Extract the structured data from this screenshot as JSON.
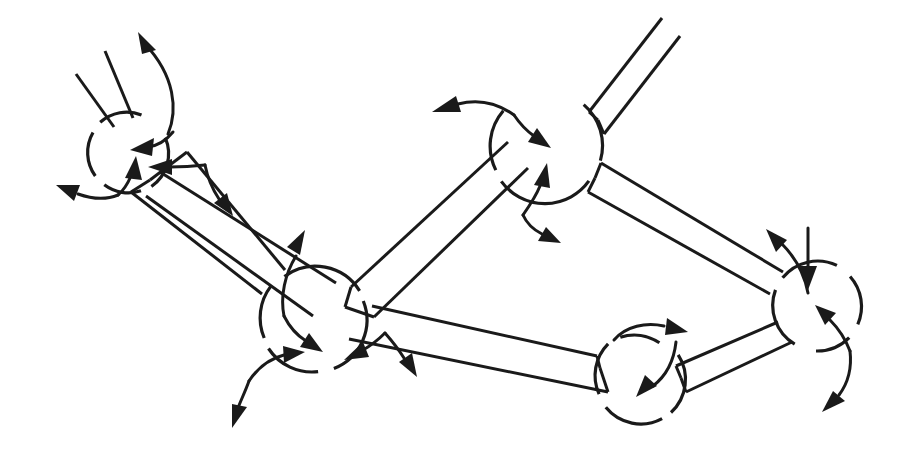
{
  "figure": {
    "kind": "diagram",
    "background_color": "#ffffff",
    "stroke_color": "#1a1a1a",
    "stroke_width": 3,
    "canvas": {
      "width": 911,
      "height": 459
    }
  },
  "nodes": [
    {
      "id": "node-top-left",
      "label": "top-left vertex",
      "cx": 128,
      "cy": 152,
      "r": 40,
      "gaps": [
        {
          "from": 206,
          "to": 262
        },
        {
          "from": 288,
          "to": 330
        },
        {
          "from": 30,
          "to": 66
        },
        {
          "from": 92,
          "to": 122
        }
      ]
    },
    {
      "id": "node-left-lower",
      "label": "left lower vertex",
      "cx": 312,
      "cy": 320,
      "r": 52,
      "gaps": [
        {
          "from": 122,
          "to": 168
        },
        {
          "from": 286,
          "to": 326
        },
        {
          "from": 38,
          "to": 72
        }
      ]
    },
    {
      "id": "node-top-right",
      "label": "top-right vertex",
      "cx": 549,
      "cy": 146,
      "r": 54,
      "gaps": [
        {
          "from": 300,
          "to": 345
        },
        {
          "from": 160,
          "to": 205
        },
        {
          "from": 8,
          "to": 50
        }
      ]
    },
    {
      "id": "node-bottom-right",
      "label": "bottom-right vertex",
      "cx": 637,
      "cy": 381,
      "r": 45,
      "gaps": [
        {
          "from": 128,
          "to": 176
        },
        {
          "from": 346,
          "to": 24
        },
        {
          "from": 56,
          "to": 86
        }
      ]
    },
    {
      "id": "node-right",
      "label": "right vertex",
      "cx": 816,
      "cy": 306,
      "r": 45,
      "gaps": [
        {
          "from": 150,
          "to": 198
        },
        {
          "from": 200,
          "to": 240
        },
        {
          "from": 118,
          "to": 146
        }
      ]
    }
  ],
  "edges": [
    {
      "id": "edge-top-left-to-open-upper",
      "label": "open tube from top-left vertex going up-left"
    },
    {
      "id": "edge-top-left-to-left-lower",
      "label": "tube from top-left vertex down to left lower vertex"
    },
    {
      "id": "edge-top-left-to-top-right-cross",
      "label": "long tube from top-left vertex crossing to top-right region"
    },
    {
      "id": "edge-left-lower-to-top-right",
      "label": "tube from left lower vertex up-right to top-right vertex"
    },
    {
      "id": "edge-top-right-to-open-upper-right",
      "label": "open tube from top-right vertex going up-right off canvas"
    },
    {
      "id": "edge-top-right-to-right",
      "label": "tube from top-right vertex down-right to right vertex"
    },
    {
      "id": "edge-bottom-right-to-right",
      "label": "tube from bottom-right vertex to right vertex"
    },
    {
      "id": "edge-left-lower-to-bottom-right",
      "label": "long tube from left lower region to bottom-right vertex"
    }
  ],
  "arrows": [
    {
      "id": "arrow-tl-out-up",
      "label": "outward arrow up from top-left vertex"
    },
    {
      "id": "arrow-tl-in-down",
      "label": "inward arrow down into top-left vertex"
    },
    {
      "id": "arrow-tl-in-up",
      "label": "inward arrow up into top-left vertex"
    },
    {
      "id": "arrow-tl-in-left",
      "label": "inward arrow left into top-left vertex"
    },
    {
      "id": "arrow-tl-out-left",
      "label": "outward arrow left from top-left vertex"
    },
    {
      "id": "arrow-tl-out-downright",
      "label": "outward arrow down-right from top-left vertex"
    },
    {
      "id": "arrow-ll-out-up",
      "label": "outward arrow up from left lower vertex"
    },
    {
      "id": "arrow-ll-in-down",
      "label": "inward arrow down into left lower vertex"
    },
    {
      "id": "arrow-ll-in-right",
      "label": "inward arrow right into left lower vertex"
    },
    {
      "id": "arrow-ll-out-down",
      "label": "outward arrow down from left lower vertex"
    },
    {
      "id": "arrow-ll-in-downleft",
      "label": "inward arrow down-left into left lower vertex"
    },
    {
      "id": "arrow-ll-out-downright",
      "label": "outward arrow down-right from left lower vertex"
    },
    {
      "id": "arrow-tr-out-left",
      "label": "outward arrow left from top-right vertex"
    },
    {
      "id": "arrow-tr-in-down",
      "label": "inward arrow down into top-right vertex"
    },
    {
      "id": "arrow-tr-in-up",
      "label": "inward arrow up into top-right vertex"
    },
    {
      "id": "arrow-tr-out-downright",
      "label": "outward arrow down-right from top-right vertex"
    },
    {
      "id": "arrow-br-out-right",
      "label": "outward arrow right from bottom-right vertex"
    },
    {
      "id": "arrow-br-in-down",
      "label": "inward arrow down into bottom-right vertex"
    },
    {
      "id": "arrow-r-out-up",
      "label": "outward arrow up from right vertex"
    },
    {
      "id": "arrow-r-in-down",
      "label": "inward arrow down into right vertex"
    },
    {
      "id": "arrow-r-in-upleft",
      "label": "inward arrow up-left into right vertex"
    },
    {
      "id": "arrow-r-out-downleft",
      "label": "outward arrow down-left from right vertex"
    }
  ]
}
